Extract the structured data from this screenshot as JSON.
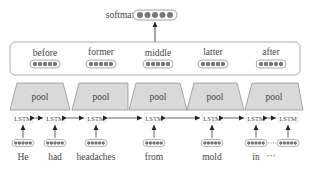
{
  "softmax": {
    "label": "softmax",
    "dots": 5
  },
  "segments": [
    {
      "label": "before"
    },
    {
      "label": "former"
    },
    {
      "label": "middle"
    },
    {
      "label": "latter"
    },
    {
      "label": "after"
    }
  ],
  "pool": {
    "label": "pool",
    "count": 5,
    "fill": "#d9d9d9"
  },
  "lstm": {
    "label": "LSTM",
    "count": 7
  },
  "tokens": [
    "He",
    "had",
    "headaches",
    "from",
    "mold",
    "in",
    "···"
  ],
  "colors": {
    "dot": "#777777",
    "stroke": "#888888",
    "box_stroke": "#aaaaaa",
    "pool_fill": "#d9d9d9"
  }
}
